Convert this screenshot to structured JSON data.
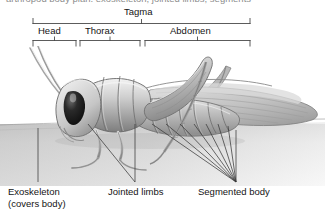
{
  "figure": {
    "style": "grayscale-pencil-illustration",
    "clipped_top_text": "arthropod body plan: exoskeleton, jointed limbs, segments"
  },
  "brackets": {
    "tagma_label": "Tagma",
    "segments": [
      {
        "label": "Head",
        "x1": 33,
        "x2": 76
      },
      {
        "label": "Thorax",
        "x1": 80,
        "x2": 140
      },
      {
        "label": "Abdomen",
        "x1": 145,
        "x2": 250
      }
    ],
    "main": {
      "x1": 33,
      "x2": 250
    }
  },
  "callouts": [
    {
      "label_line1": "Exoskeleton",
      "label_line2": "(covers body)",
      "x": 8,
      "y": 186
    },
    {
      "label_line1": "Jointed limbs",
      "label_line2": "",
      "x": 108,
      "y": 186
    },
    {
      "label_line1": "Segmented body",
      "label_line2": "",
      "x": 198,
      "y": 186
    }
  ],
  "colors": {
    "ink": "#141414",
    "bracket": "#4a4a4a",
    "leader": "#3a3a3a",
    "ground": "#d2d2d2",
    "body_light": "#e8e8e8",
    "body_mid": "#b4b4b4",
    "body_dark": "#6e6e6e",
    "eye": "#141414",
    "background": "#ffffff"
  }
}
